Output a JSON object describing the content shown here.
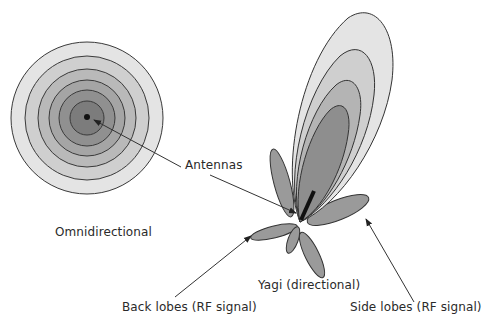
{
  "diagram": {
    "type": "antenna radiation patterns",
    "colors": {
      "ring_outline": "#3a3a3a",
      "shade_1": "#e4e4e4",
      "shade_2": "#cfcfcf",
      "shade_3": "#b9b9b9",
      "shade_4": "#a5a5a5",
      "shade_5": "#909090",
      "shade_6": "#7c7c7c",
      "lobe_fill": "#9a9a9a",
      "antenna": "#111111"
    },
    "omnidirectional": {
      "ring_count": 6
    },
    "yagi": {
      "main_lobe_contours": 4,
      "side_lobes": 2,
      "back_lobes": 2
    }
  },
  "labels": {
    "antennas": "Antennas",
    "omnidirectional": "Omnidirectional",
    "yagi": "Yagi (directional)",
    "back_lobes": "Back lobes (RF signal)",
    "side_lobes": "Side lobes (RF signal)"
  }
}
